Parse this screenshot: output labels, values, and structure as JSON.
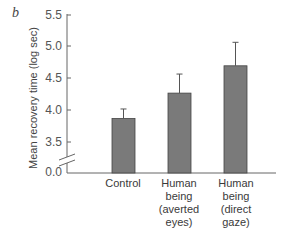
{
  "panel": {
    "label": "b"
  },
  "chart_data": {
    "type": "bar",
    "title": "",
    "xlabel": "",
    "ylabel": "Mean recovery time (log sec)",
    "categories": [
      "Control",
      "Human being (averted eyes)",
      "Human being (direct gaze)"
    ],
    "category_display": [
      "Control",
      "Human\nbeing\n(averted\neyes)",
      "Human\nbeing\n(direct\ngaze)"
    ],
    "values": [
      3.87,
      4.27,
      4.7
    ],
    "error_upper": [
      4.02,
      4.57,
      5.07
    ],
    "ylim": [
      3.5,
      5.5
    ],
    "yticks": [
      "0.0",
      "3.5",
      "4.0",
      "4.5",
      "5.0",
      "5.5"
    ],
    "axis_break": true,
    "grid": false,
    "legend": null,
    "bar_color": "#7a7a7a",
    "axis_color": "#555555"
  }
}
